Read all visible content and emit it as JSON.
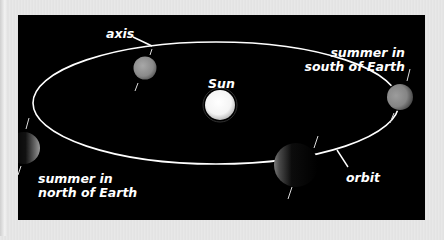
{
  "diagram": {
    "labels": {
      "axis": "axis",
      "sun": "Sun",
      "summer_south_line1": "summer in",
      "summer_south_line2": "south of Earth",
      "summer_north_line1": "summer in",
      "summer_north_line2": "north of Earth",
      "orbit": "orbit"
    },
    "elements": [
      {
        "name": "sun",
        "color": "#ffffff"
      },
      {
        "name": "earth-top",
        "lit": "full"
      },
      {
        "name": "earth-right",
        "lit": "full",
        "season": "summer in south of Earth"
      },
      {
        "name": "earth-left",
        "lit": "crescent",
        "season": "summer in north of Earth"
      },
      {
        "name": "earth-bottom",
        "lit": "crescent"
      }
    ],
    "colors": {
      "background": "#000000",
      "frame": "#e6e6e6",
      "text": "#ffffff",
      "orbit": "#ffffff"
    }
  }
}
